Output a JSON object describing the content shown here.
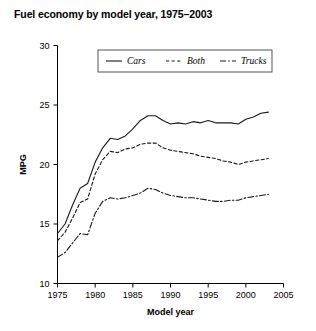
{
  "chart_data": {
    "type": "line",
    "title": "Fuel economy by model year, 1975–2003",
    "xlabel": "Model year",
    "ylabel": "MPG",
    "xlim": [
      1975,
      2005
    ],
    "ylim": [
      10,
      30
    ],
    "xticks": [
      1975,
      1980,
      1985,
      1990,
      1995,
      2000,
      2005
    ],
    "xtick_labels": [
      "1975",
      "1980",
      "1985",
      "1990",
      "1995",
      "2000",
      "2005"
    ],
    "yticks": [
      10,
      15,
      20,
      25,
      30
    ],
    "ytick_labels": [
      "10",
      "15",
      "20",
      "25",
      "30"
    ],
    "grid": false,
    "legend_position": "top-center",
    "x": [
      1975,
      1976,
      1977,
      1978,
      1979,
      1980,
      1981,
      1982,
      1983,
      1984,
      1985,
      1986,
      1987,
      1988,
      1989,
      1990,
      1991,
      1992,
      1993,
      1994,
      1995,
      1996,
      1997,
      1998,
      1999,
      2000,
      2001,
      2002,
      2003
    ],
    "series": [
      {
        "name": "Cars",
        "style": "solid",
        "color": "#1a1a1a",
        "values": [
          14.2,
          15.0,
          16.6,
          18.0,
          18.4,
          20.2,
          21.4,
          22.2,
          22.1,
          22.4,
          23.0,
          23.7,
          24.1,
          24.1,
          23.7,
          23.4,
          23.5,
          23.4,
          23.6,
          23.5,
          23.7,
          23.5,
          23.5,
          23.5,
          23.4,
          23.8,
          24.0,
          24.3,
          24.4
        ]
      },
      {
        "name": "Both",
        "style": "dashed",
        "color": "#1a1a1a",
        "values": [
          13.6,
          14.3,
          15.5,
          16.8,
          17.1,
          19.2,
          20.4,
          21.1,
          21.0,
          21.3,
          21.4,
          21.7,
          21.8,
          21.8,
          21.4,
          21.2,
          21.1,
          21.0,
          20.9,
          20.7,
          20.6,
          20.5,
          20.3,
          20.2,
          20.0,
          20.2,
          20.3,
          20.4,
          20.5
        ]
      },
      {
        "name": "Trucks",
        "style": "dashdot",
        "color": "#1a1a1a",
        "values": [
          12.2,
          12.6,
          13.4,
          14.2,
          14.1,
          15.9,
          16.9,
          17.2,
          17.1,
          17.2,
          17.4,
          17.6,
          18.0,
          17.9,
          17.6,
          17.4,
          17.3,
          17.2,
          17.2,
          17.1,
          17.0,
          16.9,
          16.9,
          17.0,
          17.0,
          17.2,
          17.3,
          17.4,
          17.5
        ]
      }
    ]
  },
  "legend": {
    "items": [
      {
        "label": "Cars",
        "style": "solid"
      },
      {
        "label": "Both",
        "style": "dashed"
      },
      {
        "label": "Trucks",
        "style": "dashdot"
      }
    ]
  }
}
